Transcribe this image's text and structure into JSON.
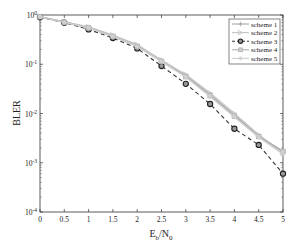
{
  "chart_data": {
    "type": "line",
    "title": "",
    "xlabel": "E_b/N_0",
    "ylabel": "BLER",
    "yscale": "log",
    "xlim": [
      0,
      5
    ],
    "ylim": [
      0.0001,
      1
    ],
    "grid": false,
    "legend_position": "upper right",
    "x": [
      0,
      0.5,
      1,
      1.5,
      2,
      2.5,
      3,
      3.5,
      4,
      4.5,
      5
    ],
    "x_tick_labels": [
      "0",
      "0.5",
      "1",
      "1.5",
      "2",
      "2.5",
      "3",
      "3.5",
      "4",
      "4.5",
      "5"
    ],
    "y_ticks": [
      1,
      0.1,
      0.01,
      0.001,
      0.0001
    ],
    "y_tick_labels": [
      {
        "base": "10",
        "exp": "0"
      },
      {
        "base": "10",
        "exp": "-1"
      },
      {
        "base": "10",
        "exp": "-2"
      },
      {
        "base": "10",
        "exp": "-3"
      },
      {
        "base": "10",
        "exp": "-4"
      }
    ],
    "series": [
      {
        "name": "scheme 1",
        "color": "#a8a8a8",
        "dash": "solid",
        "marker": "plus",
        "values": [
          0.93,
          0.72,
          0.56,
          0.38,
          0.24,
          0.12,
          0.058,
          0.024,
          0.0092,
          0.0035,
          0.0017
        ]
      },
      {
        "name": "scheme 2",
        "color": "#c4c4c4",
        "dash": "solid",
        "marker": "triangle-right",
        "values": [
          0.93,
          0.72,
          0.57,
          0.39,
          0.25,
          0.12,
          0.062,
          0.026,
          0.01,
          0.0037,
          0.0016
        ]
      },
      {
        "name": "scheme 3",
        "color": "#333333",
        "dash": "dashed",
        "marker": "circle",
        "values": [
          0.9,
          0.7,
          0.51,
          0.34,
          0.21,
          0.092,
          0.04,
          0.0156,
          0.0049,
          0.0023,
          0.0006
        ]
      },
      {
        "name": "scheme 4",
        "color": "#b0b0b0",
        "dash": "solid",
        "marker": "square",
        "values": [
          0.92,
          0.71,
          0.55,
          0.37,
          0.23,
          0.115,
          0.056,
          0.023,
          0.0088,
          0.0034,
          0.0017
        ]
      },
      {
        "name": "scheme 5",
        "color": "#cfcfcf",
        "dash": "solid",
        "marker": "star",
        "values": [
          0.92,
          0.71,
          0.55,
          0.37,
          0.23,
          0.113,
          0.055,
          0.022,
          0.0085,
          0.0033,
          0.0015
        ]
      }
    ]
  }
}
